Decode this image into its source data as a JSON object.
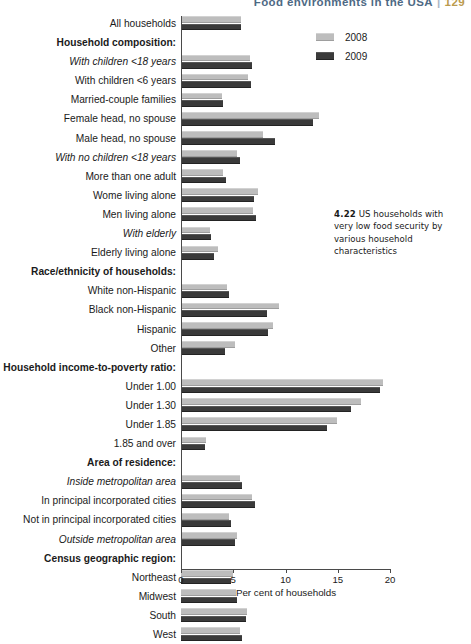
{
  "running_header": {
    "title": "Food environments in the USA",
    "separator": "|",
    "page": "129"
  },
  "caption": {
    "number": "4.22",
    "text": "US households with very low food security by various household characteristics"
  },
  "legend": {
    "position": "top-right",
    "items": [
      {
        "label": "2008",
        "color": "#bdbdbd",
        "key": "y2008"
      },
      {
        "label": "2009",
        "color": "#3a3a3a",
        "key": "y2009"
      }
    ]
  },
  "axis": {
    "title": "Per cent of households",
    "ticks": [
      "0",
      "5",
      "10",
      "15",
      "20"
    ],
    "min": 0,
    "max": 20
  },
  "chart_data": {
    "type": "bar",
    "orientation": "horizontal",
    "title": "US households with very low food security by various household characteristics",
    "xlabel": "Per cent of households",
    "ylabel": "",
    "xlim": [
      0,
      20
    ],
    "grid": false,
    "legend_position": "top-right",
    "categories": [
      "All households",
      "Household composition:",
      "With children <18 years",
      "With children <6 years",
      "Married-couple families",
      "Female head, no spouse",
      "Male head, no spouse",
      "With no children <18 years",
      "More than one adult",
      "Wome living alone",
      "Men living alone",
      "With elderly",
      "Elderly living alone",
      "Race/ethnicity of households:",
      "White non-Hispanic",
      "Black non-Hispanic",
      "Hispanic",
      "Other",
      "Household income-to-poverty ratio:",
      "Under 1.00",
      "Under 1.30",
      "Under 1.85",
      "1.85 and over",
      "Area of residence:",
      "Inside metropolitan area",
      "In principal incorporated cities",
      "Not in principal incorporated cities",
      "Outside metropolitan area",
      "Census geographic region:",
      "Northeast",
      "Midwest",
      "South",
      "West"
    ],
    "series": [
      {
        "name": "2008",
        "color": "#bdbdbd",
        "values": [
          5.7,
          null,
          6.6,
          6.4,
          3.9,
          13.2,
          7.8,
          5.4,
          4.0,
          7.4,
          6.9,
          2.8,
          3.5,
          null,
          4.4,
          9.4,
          8.8,
          5.2,
          null,
          19.3,
          17.2,
          14.9,
          2.4,
          null,
          5.6,
          6.8,
          4.6,
          5.4,
          null,
          5.0,
          5.3,
          6.3,
          5.6
        ]
      },
      {
        "name": "2009",
        "color": "#3a3a3a",
        "values": [
          5.7,
          null,
          6.8,
          6.7,
          4.0,
          12.6,
          9.0,
          5.6,
          4.3,
          7.0,
          7.2,
          2.9,
          3.2,
          null,
          4.6,
          8.2,
          8.3,
          4.2,
          null,
          19.0,
          16.3,
          14.0,
          2.3,
          null,
          5.8,
          7.1,
          4.8,
          5.2,
          null,
          4.8,
          5.4,
          6.2,
          5.8
        ]
      }
    ],
    "row_styles": [
      "normal",
      "header",
      "italic",
      "normal",
      "normal",
      "normal",
      "normal",
      "italic",
      "normal",
      "normal",
      "normal",
      "italic",
      "normal",
      "header",
      "normal",
      "normal",
      "normal",
      "normal",
      "header",
      "normal",
      "normal",
      "normal",
      "normal",
      "header",
      "italic",
      "normal",
      "normal",
      "italic",
      "header",
      "normal",
      "normal",
      "normal",
      "normal"
    ]
  }
}
